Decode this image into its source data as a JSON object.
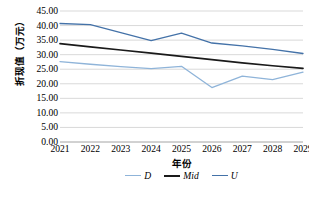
{
  "chart_data": {
    "type": "line",
    "title": "",
    "xlabel": "年份",
    "ylabel": "折现值（万元）",
    "categories": [
      "2021",
      "2022",
      "2023",
      "2024",
      "2025",
      "2026",
      "2027",
      "2028",
      "2029"
    ],
    "ylim": [
      0,
      45
    ],
    "ytick_step": 5,
    "ytick_labels": [
      "45.00",
      "40.00",
      "35.00",
      "30.00",
      "25.00",
      "20.00",
      "15.00",
      "10.00",
      "5.00",
      "0.00"
    ],
    "ytick_values": [
      45,
      40,
      35,
      30,
      25,
      20,
      15,
      10,
      5,
      0
    ],
    "grid": "horizontal",
    "legend_position": "bottom",
    "series": [
      {
        "name": "D",
        "color": "#8fb4d9",
        "values": [
          27.6,
          26.7,
          25.9,
          25.2,
          26.0,
          18.7,
          22.6,
          21.4,
          24.0
        ]
      },
      {
        "name": "Mid",
        "color": "#1a1a1a",
        "values": [
          33.8,
          32.7,
          31.6,
          30.5,
          29.4,
          28.3,
          27.2,
          26.2,
          25.3
        ]
      },
      {
        "name": "U",
        "color": "#4472a8",
        "values": [
          40.7,
          40.3,
          37.6,
          34.8,
          37.4,
          34.0,
          33.0,
          31.8,
          30.4
        ]
      }
    ]
  }
}
